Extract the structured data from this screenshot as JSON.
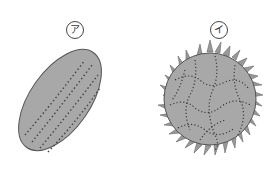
{
  "figure": {
    "colors": {
      "grain_fill": "#a8a8a8",
      "grain_stroke": "#555555",
      "dots": "#333333",
      "background": "#ffffff"
    },
    "grains": [
      {
        "label": "ア",
        "shape": "elliptical with longitudinal furrows (colpi)"
      },
      {
        "label": "イ",
        "shape": "spherical with spines (echinate)"
      }
    ]
  }
}
